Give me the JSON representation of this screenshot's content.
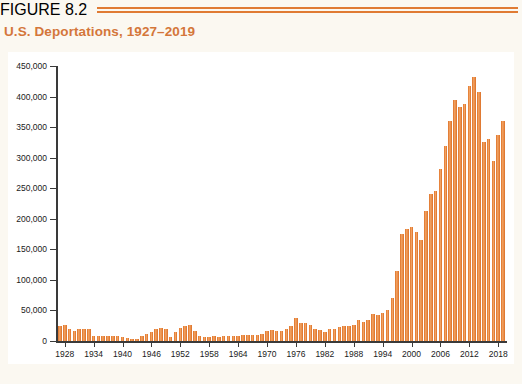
{
  "header": {
    "figure_label": "FIGURE 8.2",
    "title": "U.S. Deportations, 1927–2019",
    "accent_color": "#D4763A",
    "rule_color": "#E07B33"
  },
  "chart_data": {
    "type": "bar",
    "title": "U.S. Deportations, 1927–2019",
    "xlabel": "",
    "ylabel": "",
    "ylim": [
      0,
      450000
    ],
    "ytick_step": 50000,
    "grid": false,
    "legend": null,
    "bar_color": "#E8843C",
    "plot_background": "#FFFFFF",
    "page_background": "#FBF8F1",
    "ytick_labels": [
      "0",
      "50,000",
      "100,000",
      "150,000",
      "200,000",
      "250,000",
      "300,000",
      "350,000",
      "400,000",
      "450,000"
    ],
    "ytick_values": [
      0,
      50000,
      100000,
      150000,
      200000,
      250000,
      300000,
      350000,
      400000,
      450000
    ],
    "xtick_labels": [
      "1928",
      "1934",
      "1940",
      "1946",
      "1952",
      "1958",
      "1964",
      "1970",
      "1976",
      "1982",
      "1988",
      "1994",
      "2000",
      "2006",
      "2012",
      "2018"
    ],
    "xtick_years": [
      1928,
      1934,
      1940,
      1946,
      1952,
      1958,
      1964,
      1970,
      1976,
      1982,
      1988,
      1994,
      2000,
      2006,
      2012,
      2018
    ],
    "x_range": [
      1927,
      2019
    ],
    "categories": [
      1927,
      1928,
      1929,
      1930,
      1931,
      1932,
      1933,
      1934,
      1935,
      1936,
      1937,
      1938,
      1939,
      1940,
      1941,
      1942,
      1943,
      1944,
      1945,
      1946,
      1947,
      1948,
      1949,
      1950,
      1951,
      1952,
      1953,
      1954,
      1955,
      1956,
      1957,
      1958,
      1959,
      1960,
      1961,
      1962,
      1963,
      1964,
      1965,
      1966,
      1967,
      1968,
      1969,
      1970,
      1971,
      1972,
      1973,
      1974,
      1975,
      1976,
      1977,
      1978,
      1979,
      1980,
      1981,
      1982,
      1983,
      1984,
      1985,
      1986,
      1987,
      1988,
      1989,
      1990,
      1991,
      1992,
      1993,
      1994,
      1995,
      1996,
      1997,
      1998,
      1999,
      2000,
      2001,
      2002,
      2003,
      2004,
      2005,
      2006,
      2007,
      2008,
      2009,
      2010,
      2011,
      2012,
      2013,
      2014,
      2015,
      2016,
      2017,
      2018,
      2019
    ],
    "values": [
      25000,
      27000,
      20000,
      17000,
      19000,
      20000,
      20000,
      9000,
      9000,
      9000,
      9000,
      9000,
      9000,
      7000,
      5000,
      4000,
      4000,
      8000,
      11000,
      15000,
      19000,
      21000,
      20000,
      7000,
      14000,
      21000,
      24000,
      27000,
      17000,
      8000,
      6000,
      7000,
      8000,
      7000,
      8000,
      8000,
      8000,
      9000,
      10000,
      10000,
      10000,
      10000,
      11000,
      17000,
      18000,
      17000,
      17000,
      19000,
      24000,
      38000,
      30000,
      29000,
      26000,
      19000,
      18000,
      15000,
      20000,
      19000,
      23000,
      25000,
      25000,
      26000,
      34000,
      31000,
      34000,
      44000,
      43000,
      46000,
      51000,
      70000,
      115000,
      175000,
      184000,
      186000,
      178000,
      166000,
      212000,
      241000,
      246000,
      281000,
      319000,
      360000,
      395000,
      383000,
      388000,
      417000,
      432000,
      407000,
      325000,
      330000,
      295000,
      337000,
      360000
    ]
  }
}
